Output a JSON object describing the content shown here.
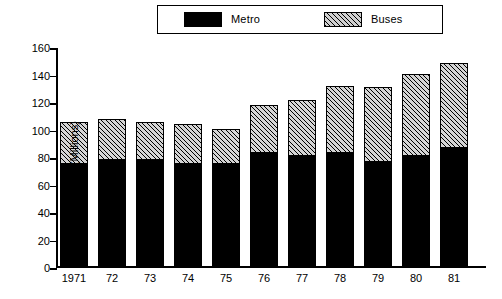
{
  "legend": {
    "entries": [
      {
        "label": "Metro",
        "swatch": "solid-black-swatch"
      },
      {
        "label": "Buses",
        "swatch": "hatched-swatch"
      }
    ]
  },
  "axes": {
    "y_title": "Annual vehicle kms (Millions)",
    "y_ticks": [
      "160",
      "140",
      "120",
      "100",
      "80",
      "60",
      "40",
      "20",
      "0"
    ],
    "x_ticks": [
      "1971",
      "72",
      "73",
      "74",
      "75",
      "76",
      "77",
      "78",
      "79",
      "80",
      "81"
    ]
  },
  "colors": {
    "metro": "#000000",
    "buses": "#d4d4d4",
    "axis": "#000000",
    "background": "#ffffff"
  },
  "chart_data": {
    "type": "bar",
    "stacked": true,
    "title": "",
    "subtitle": "",
    "xlabel": "",
    "ylabel": "Annual vehicle kms (Millions)",
    "ylim": [
      0,
      160
    ],
    "ytick_step": 20,
    "grid": false,
    "legend_position": "top",
    "categories": [
      "1971",
      "72",
      "73",
      "74",
      "75",
      "76",
      "77",
      "78",
      "79",
      "80",
      "81"
    ],
    "series": [
      {
        "name": "Metro",
        "values": [
          74,
          77,
          77,
          74,
          74,
          82,
          80,
          82,
          76,
          80,
          86
        ]
      },
      {
        "name": "Buses",
        "values": [
          31,
          30,
          28,
          29,
          26,
          35,
          41,
          49,
          54,
          60,
          62
        ]
      }
    ],
    "totals": [
      105,
      107,
      105,
      103,
      100,
      117,
      121,
      131,
      130,
      140,
      148
    ]
  }
}
